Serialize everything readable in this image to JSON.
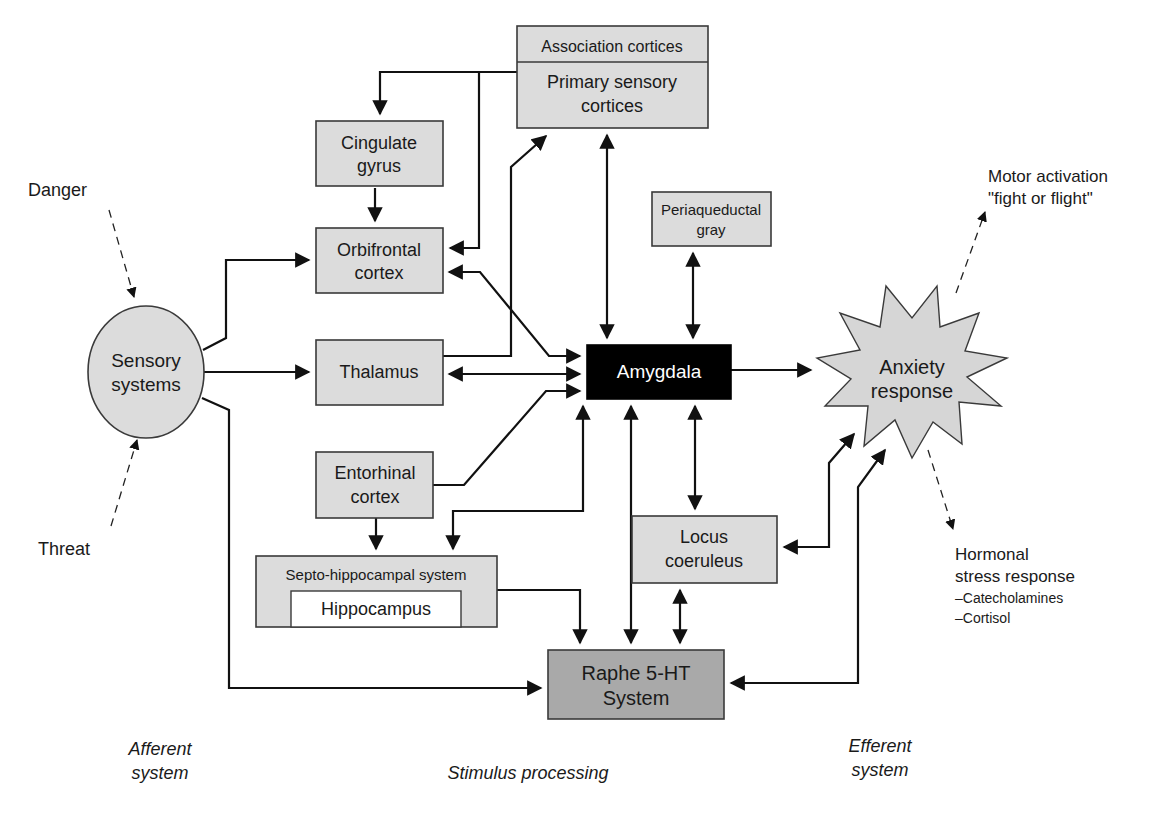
{
  "diagram": {
    "nodes": {
      "association_cortices": "Association cortices",
      "primary_sensory_cortices": [
        "Primary sensory",
        "cortices"
      ],
      "cingulate_gyrus": [
        "Cingulate",
        "gyrus"
      ],
      "orbifrontal_cortex": [
        "Orbifrontal",
        "cortex"
      ],
      "thalamus": "Thalamus",
      "entorhinal_cortex": [
        "Entorhinal",
        "cortex"
      ],
      "septo_hippocampal_system": "Septo-hippocampal system",
      "hippocampus": "Hippocampus",
      "periaqueductal_gray": [
        "Periaqueductal",
        "gray"
      ],
      "amygdala": "Amygdala",
      "locus_coeruleus": [
        "Locus",
        "coeruleus"
      ],
      "raphe_system": [
        "Raphe 5-HT",
        "System"
      ],
      "sensory_systems": [
        "Sensory",
        "systems"
      ],
      "anxiety_response": [
        "Anxiety",
        "response"
      ]
    },
    "inputs": {
      "danger": "Danger",
      "threat": "Threat"
    },
    "outputs": {
      "motor": [
        "Motor activation",
        "\"fight or flight\""
      ],
      "hormonal": [
        "Hormonal",
        "stress response",
        "–Catecholamines",
        "–Cortisol"
      ]
    },
    "section_labels": {
      "afferent": [
        "Afferent",
        "system"
      ],
      "stimulus": "Stimulus processing",
      "efferent": [
        "Efferent",
        "system"
      ]
    },
    "colors": {
      "box_fill": "#dcdcdc",
      "raphe_fill": "#a9a9a9",
      "amygdala_fill": "#000000",
      "line": "#111111"
    }
  }
}
